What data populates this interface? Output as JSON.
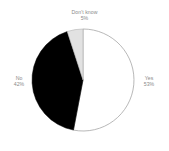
{
  "chart_data": {
    "type": "pie",
    "title": "",
    "subtitle": "",
    "xlabel": "",
    "ylabel": "",
    "legend_position": "none",
    "grid": false,
    "start_angle_deg": 0,
    "direction": "clockwise",
    "categories": [
      "Yes",
      "No",
      "Don't know"
    ],
    "values": [
      53,
      42,
      5
    ],
    "value_suffix": "%",
    "slices": [
      {
        "label": "Yes",
        "value": 53,
        "value_text": "53%",
        "color": "#ffffff",
        "stroke": "#9a9a9a",
        "label_position": "right"
      },
      {
        "label": "No",
        "value": 42,
        "value_text": "42%",
        "color": "#000000",
        "stroke": "#000000",
        "label_position": "left"
      },
      {
        "label": "Don't know",
        "value": 5,
        "value_text": "5%",
        "color": "#e2e2e2",
        "stroke": "#b0b0b0",
        "label_position": "top"
      }
    ]
  },
  "labels": {
    "yes_name": "Yes",
    "yes_value": "53%",
    "no_name": "No",
    "no_value": "42%",
    "dontknow_name": "Don't know",
    "dontknow_value": "5%"
  },
  "colors": {
    "background": "#ffffff",
    "slice_yes": "#ffffff",
    "slice_no": "#000000",
    "slice_dontknow": "#e2e2e2",
    "outline": "#9a9a9a",
    "label_text": "#8a8a8a"
  }
}
